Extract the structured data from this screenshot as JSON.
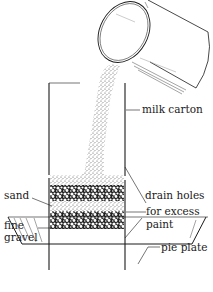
{
  "diagram": {
    "title": "",
    "labels": {
      "milk_carton": "milk carton",
      "sand": "sand",
      "fine_gravel_1": "fine",
      "fine_gravel_2": "gravel",
      "drain_holes_1": "drain holes",
      "drain_holes_2": "for excess",
      "drain_holes_3": "paint",
      "pie_plate": "pie plate"
    },
    "colors": {
      "ink": "#1a1a1a",
      "background": "#ffffff",
      "sand_fill": "#d9d9d9",
      "gravel_fill": "#2a2a2a"
    }
  }
}
